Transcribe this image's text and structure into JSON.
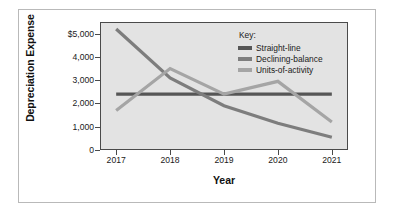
{
  "figure": {
    "background_color": "#ffffff",
    "plot_background_color": "#e3e3e3",
    "plot_border_color": "#4a4a4a"
  },
  "legend": {
    "title": "Key:",
    "position": "top-right inside plot",
    "entries": [
      {
        "label": "Straight-line",
        "color": "#565656"
      },
      {
        "label": "Declining-balance",
        "color": "#7d7d7d"
      },
      {
        "label": "Units-of-activity",
        "color": "#a5a5a5"
      }
    ]
  },
  "chart_data": {
    "type": "line",
    "title": "",
    "xlabel": "Year",
    "ylabel": "Depreciation Expense",
    "categories": [
      "2017",
      "2018",
      "2019",
      "2020",
      "2021"
    ],
    "x": [
      2017,
      2018,
      2019,
      2020,
      2021
    ],
    "ylim": [
      0,
      5500
    ],
    "xlim": [
      2016.7,
      2021.3
    ],
    "yticks": [
      0,
      1000,
      2000,
      3000,
      4000,
      5000
    ],
    "ytick_labels": [
      "0",
      "1,000",
      "2,000",
      "3,000",
      "4,000",
      "$5,000"
    ],
    "xtick_labels": [
      "2017",
      "2018",
      "2019",
      "2020",
      "2021"
    ],
    "grid": false,
    "legend_position": "upper right",
    "series": [
      {
        "name": "Straight-line",
        "color": "#565656",
        "values": [
          2400,
          2400,
          2400,
          2400,
          2400
        ]
      },
      {
        "name": "Declining-balance",
        "color": "#7d7d7d",
        "values": [
          5200,
          3100,
          1900,
          1150,
          550
        ]
      },
      {
        "name": "Units-of-activity",
        "color": "#a5a5a5",
        "values": [
          1700,
          3500,
          2400,
          2950,
          1200
        ]
      }
    ]
  }
}
